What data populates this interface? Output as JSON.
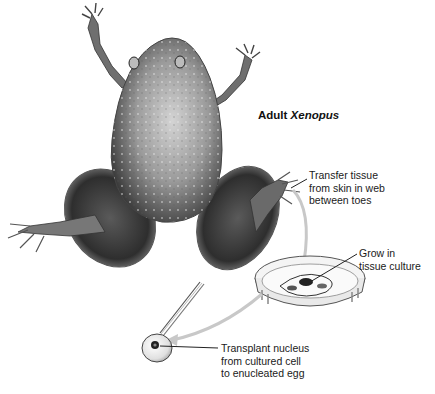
{
  "figure": {
    "title_prefix": "Adult",
    "title_species": "Xenopus",
    "steps": [
      {
        "id": "transfer",
        "text": "Transfer tissue\nfrom skin in web\nbetween toes"
      },
      {
        "id": "grow",
        "text": "Grow in\ntissue culture"
      },
      {
        "id": "transplant",
        "text": "Transplant nucleus\nfrom cultured cell\nto enucleated egg"
      }
    ],
    "colors": {
      "ink": "#1a1a1a",
      "arrow": "#c8c8c8",
      "frog_dark": "#3a3a3a",
      "frog_mid": "#7a7a7a",
      "frog_light": "#c9c9c9"
    }
  }
}
